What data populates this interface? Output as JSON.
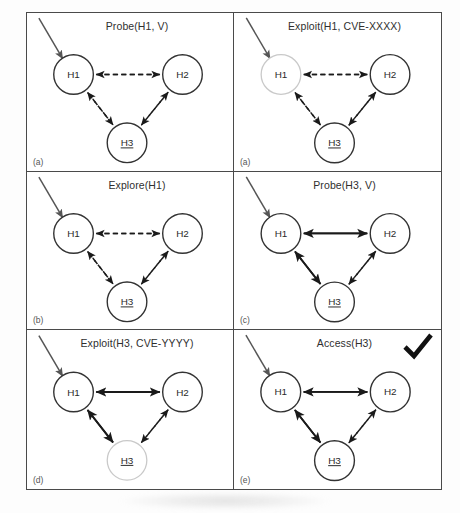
{
  "figure": {
    "background_color": "#fdfdfd",
    "border_color": "#4a4a4a",
    "node_stroke_normal": "#333333",
    "node_stroke_highlight": "#c9c9c9",
    "edge_color": "#1a1a1a",
    "check_color": "#111111",
    "nodes": {
      "h1": "H1",
      "h2": "H2",
      "h3": "H3"
    },
    "panels": [
      {
        "id": "panel-probe-h1",
        "title": "Probe(H1, V)",
        "label": "(a)",
        "highlight_node": "",
        "checkmark": false,
        "edges": {
          "h1_h2": "dashed",
          "h1_h3": "dashed",
          "h2_h3": "dashed"
        },
        "entry_arrow": true
      },
      {
        "id": "panel-exploit-h1",
        "title": "Exploit(H1, CVE-XXXX)",
        "label": "(a)",
        "highlight_node": "h1",
        "checkmark": false,
        "edges": {
          "h1_h2": "dashed",
          "h1_h3": "dashed",
          "h2_h3": "dashed"
        },
        "entry_arrow": true
      },
      {
        "id": "panel-explore-h1",
        "title": "Explore(H1)",
        "label": "(b)",
        "highlight_node": "",
        "checkmark": false,
        "edges": {
          "h1_h2": "dashed",
          "h1_h3": "dashed",
          "h2_h3": "dashed"
        },
        "entry_arrow": true
      },
      {
        "id": "panel-probe-h3",
        "title": "Probe(H3, V)",
        "label": "(c)",
        "highlight_node": "",
        "checkmark": false,
        "edges": {
          "h1_h2": "solid",
          "h1_h3": "solid",
          "h2_h3": "dashed"
        },
        "entry_arrow": true
      },
      {
        "id": "panel-exploit-h3",
        "title": "Exploit(H3, CVE-YYYY)",
        "label": "(d)",
        "highlight_node": "h3",
        "checkmark": false,
        "edges": {
          "h1_h2": "solid",
          "h1_h3": "solid",
          "h2_h3": "dashed"
        },
        "entry_arrow": true
      },
      {
        "id": "panel-access-h3",
        "title": "Access(H3)",
        "label": "(e)",
        "highlight_node": "",
        "checkmark": true,
        "edges": {
          "h1_h2": "solid",
          "h1_h3": "solid",
          "h2_h3": "dashed"
        },
        "entry_arrow": true
      }
    ]
  }
}
